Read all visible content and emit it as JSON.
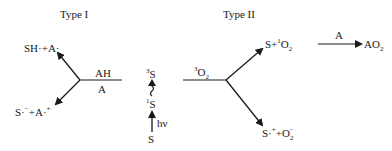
{
  "type1": {
    "title": "Type I",
    "upper_product": "SH·+A·",
    "reagent_above": "AH",
    "reagent_below": "A",
    "lower_product_base": "S·",
    "lower_product_sup1": "−",
    "lower_product_mid": "+A·",
    "lower_product_sup2": "+"
  },
  "excitation": {
    "triplet_sup": "3",
    "triplet": "S",
    "singlet_sup": "1",
    "singlet": "S",
    "light_label": "hν",
    "ground": "S"
  },
  "type2": {
    "title": "Type II",
    "reagent_sup": "3",
    "reagent": "O",
    "reagent_sub": "2",
    "upper_product_a": "S+",
    "upper_product_sup": "1",
    "upper_product_b": "O",
    "upper_product_sub": "2",
    "oxidant": "A",
    "final_product": "AO",
    "final_product_sub": "2",
    "lower_product_a": "S·",
    "lower_product_sup": "+",
    "lower_product_b": "+O",
    "lower_product_sub": "2",
    "lower_product_sup2": "−"
  },
  "colors": {
    "ink": "#1a1a1a",
    "background": "#ffffff"
  }
}
